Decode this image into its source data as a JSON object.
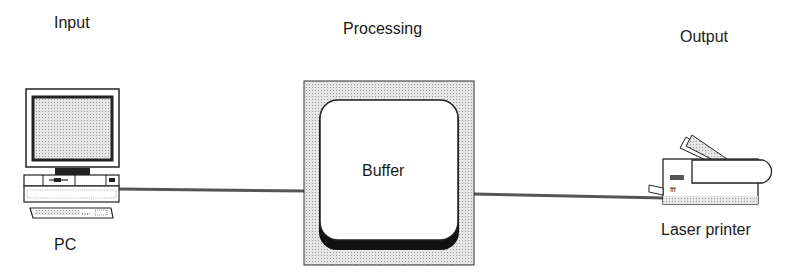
{
  "diagram": {
    "stages": [
      {
        "heading": "Input",
        "device_label": "PC"
      },
      {
        "heading": "Processing",
        "device_label": "Buffer"
      },
      {
        "heading": "Output",
        "device_label": "Laser printer"
      }
    ],
    "colors": {
      "line": "#555555",
      "shade": "#d9d9d9",
      "outline": "#222222"
    }
  }
}
